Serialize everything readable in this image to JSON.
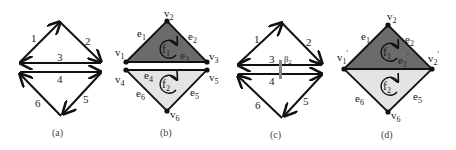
{
  "colors": {
    "edge": "#111111",
    "face_dark": "#6b6b6b",
    "face_light": "#e4e4e4",
    "marker": "#888888",
    "background": "#ffffff"
  },
  "panels": [
    {
      "id": "a",
      "caption": "(a)",
      "type": "directed-half-edges",
      "edge_labels": [
        "1",
        "2",
        "3",
        "4",
        "5",
        "6"
      ]
    },
    {
      "id": "b",
      "caption": "(b)",
      "type": "faces-graph",
      "vertices": [
        "v",
        "v",
        "v",
        "v",
        "v",
        "v"
      ],
      "vertex_subs": [
        "1",
        "2",
        "3",
        "4",
        "5",
        "6"
      ],
      "edges": [
        "e",
        "e",
        "e",
        "e",
        "e",
        "e"
      ],
      "edge_subs": [
        "1",
        "2",
        "3",
        "4",
        "6",
        "5"
      ],
      "faces": [
        "f",
        "f"
      ],
      "face_subs": [
        "1",
        "2"
      ]
    },
    {
      "id": "c",
      "caption": "(c)",
      "type": "directed-half-edges-merged",
      "edge_labels": [
        "1",
        "2",
        "3",
        "4",
        "5",
        "6"
      ],
      "marker_label": "β",
      "marker_sub": "2"
    },
    {
      "id": "d",
      "caption": "(d)",
      "type": "merged-faces-graph",
      "vertices": [
        "v",
        "v",
        "v",
        "v"
      ],
      "vertex_subs": [
        "1",
        "2",
        "2",
        "6"
      ],
      "vertex_primes": [
        "'",
        "",
        "'",
        ""
      ],
      "edges": [
        "e",
        "e",
        "e",
        "e",
        "e"
      ],
      "edge_subs": [
        "1",
        "2",
        "1",
        "6",
        "5"
      ],
      "edge_primes": [
        "",
        "",
        "'",
        "",
        ""
      ],
      "faces": [
        "f",
        "f"
      ],
      "face_subs": [
        "1",
        "2"
      ]
    }
  ]
}
